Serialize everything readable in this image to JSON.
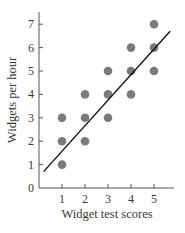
{
  "chart_data": {
    "type": "scatter",
    "title": "",
    "xlabel": "Widget test scores",
    "ylabel": "Widgets per hour",
    "x_ticks": [
      1,
      2,
      3,
      4,
      5
    ],
    "y_ticks": [
      0,
      1,
      2,
      3,
      4,
      5,
      6,
      7
    ],
    "origin_label": "0",
    "xlim": [
      0,
      5.7
    ],
    "ylim": [
      0,
      7.6
    ],
    "grid": false,
    "legend": null,
    "series": [
      {
        "name": "Observations",
        "points": [
          {
            "x": 1,
            "y": 1
          },
          {
            "x": 1,
            "y": 2
          },
          {
            "x": 1,
            "y": 3
          },
          {
            "x": 2,
            "y": 2
          },
          {
            "x": 2,
            "y": 3
          },
          {
            "x": 2,
            "y": 4
          },
          {
            "x": 3,
            "y": 3
          },
          {
            "x": 3,
            "y": 4
          },
          {
            "x": 3,
            "y": 5
          },
          {
            "x": 4,
            "y": 4
          },
          {
            "x": 4,
            "y": 5
          },
          {
            "x": 4,
            "y": 6
          },
          {
            "x": 5,
            "y": 5
          },
          {
            "x": 5,
            "y": 6
          },
          {
            "x": 5,
            "y": 7
          }
        ]
      }
    ],
    "trend_line": {
      "x_start": 0.2,
      "y_start": 0.7,
      "x_end": 5.7,
      "y_end": 6.7,
      "slope": 1.0,
      "intercept": 0.8
    },
    "colors": {
      "points": "#7a7a7a",
      "line": "#111111",
      "axes": "#555555",
      "text": "#3a3a3a"
    }
  }
}
